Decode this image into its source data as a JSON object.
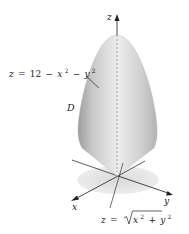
{
  "figure": {
    "axes": {
      "x": "x",
      "y": "y",
      "z": "z"
    },
    "region_label": "D",
    "upper_surface": {
      "lhs": "z",
      "eq": "=",
      "const": "12",
      "minus1": "−",
      "x": "x",
      "exp1": "2",
      "minus2": "−",
      "y": "y",
      "exp2": "2"
    },
    "lower_surface": {
      "lhs": "z",
      "eq": "=",
      "x": "x",
      "exp1": "2",
      "plus": "+",
      "y": "y",
      "exp2": "2"
    },
    "colors": {
      "surface_light": "#f2f2f2",
      "surface_dark": "#a9a9a9",
      "shadow": "#e4e4e4",
      "axis": "#333333"
    }
  }
}
